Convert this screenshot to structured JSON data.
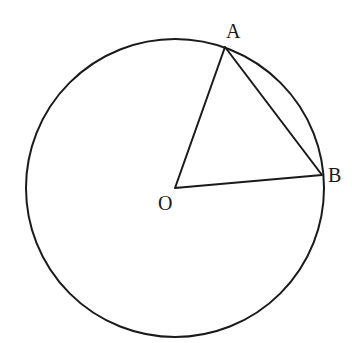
{
  "diagram": {
    "type": "circle-with-inscribed-triangle",
    "circle": {
      "center": "O",
      "cx": 175,
      "cy": 188,
      "r": 149
    },
    "points": {
      "O": {
        "label": "O",
        "x": 175,
        "y": 188,
        "label_x": 158,
        "label_y": 210
      },
      "A": {
        "label": "A",
        "x": 225,
        "y": 47,
        "label_x": 226,
        "label_y": 38
      },
      "B": {
        "label": "B",
        "x": 322,
        "y": 175,
        "label_x": 328,
        "label_y": 182
      }
    },
    "segments": [
      "OA",
      "AB",
      "OB"
    ],
    "stroke_color": "#1a1a1a",
    "background": "#ffffff"
  }
}
